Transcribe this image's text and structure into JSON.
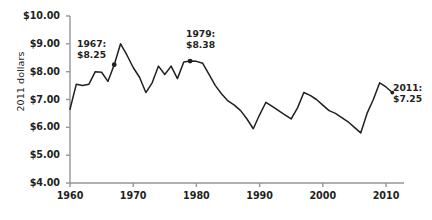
{
  "chart_data": {
    "type": "line",
    "title": "",
    "subtitle": "",
    "xlabel": "",
    "ylabel": "2011 dollars",
    "xlim": [
      1960,
      2011
    ],
    "ylim": [
      4.0,
      10.0
    ],
    "grid": false,
    "legend": null,
    "y_tick_labels": [
      "$10.00",
      "$9.00",
      "$8.00",
      "$7.00",
      "$6.00",
      "$5.00",
      "$4.00"
    ],
    "y_tick_values": [
      10.0,
      9.0,
      8.0,
      7.0,
      6.0,
      5.0,
      4.0
    ],
    "x_tick_labels": [
      "1960",
      "1970",
      "1980",
      "1990",
      "2000",
      "2010"
    ],
    "x_tick_values": [
      1960,
      1970,
      1980,
      1990,
      2000,
      2010
    ],
    "series": [
      {
        "name": "Minimum wage in 2011 dollars",
        "x": [
          1960,
          1961,
          1962,
          1963,
          1964,
          1965,
          1966,
          1967,
          1968,
          1969,
          1970,
          1971,
          1972,
          1973,
          1974,
          1975,
          1976,
          1977,
          1978,
          1979,
          1980,
          1981,
          1982,
          1983,
          1984,
          1985,
          1986,
          1987,
          1988,
          1989,
          1990,
          1991,
          1992,
          1993,
          1994,
          1995,
          1996,
          1997,
          1998,
          1999,
          2000,
          2001,
          2002,
          2003,
          2004,
          2005,
          2006,
          2007,
          2008,
          2009,
          2010,
          2011
        ],
        "values": [
          6.65,
          7.55,
          7.5,
          7.55,
          8.0,
          7.98,
          7.65,
          8.25,
          9.0,
          8.6,
          8.15,
          7.8,
          7.25,
          7.6,
          8.2,
          7.9,
          8.2,
          7.75,
          8.35,
          8.38,
          8.37,
          8.3,
          7.9,
          7.5,
          7.2,
          6.95,
          6.8,
          6.6,
          6.3,
          5.95,
          6.45,
          6.9,
          6.75,
          6.6,
          6.45,
          6.3,
          6.7,
          7.25,
          7.15,
          7.0,
          6.8,
          6.6,
          6.5,
          6.35,
          6.2,
          6.0,
          5.8,
          6.5,
          7.0,
          7.6,
          7.45,
          7.25
        ]
      }
    ],
    "annotations": [
      {
        "name": "annotation-1967",
        "year_label": "1967:",
        "value_label": "$8.25",
        "x": 1967,
        "y": 8.25,
        "marker": true
      },
      {
        "name": "annotation-1979",
        "year_label": "1979:",
        "value_label": "$8.38",
        "x": 1979,
        "y": 8.38,
        "marker": true
      },
      {
        "name": "annotation-2011",
        "year_label": "2011:",
        "value_label": "$7.25",
        "x": 2011,
        "y": 7.25,
        "marker": true
      }
    ],
    "colors": {
      "line": "#231f20",
      "axis": "#939598",
      "text": "#231f20",
      "background": "#ffffff"
    }
  }
}
